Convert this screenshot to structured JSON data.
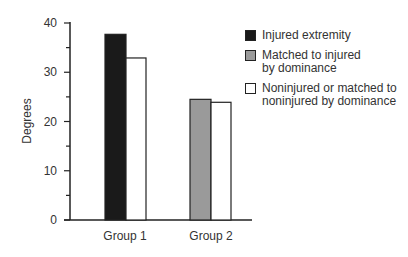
{
  "chart_data": {
    "type": "bar",
    "title": "",
    "xlabel": "",
    "ylabel": "Degrees",
    "ylim": [
      0,
      40
    ],
    "yticks": [
      0,
      10,
      20,
      30,
      40
    ],
    "grid": false,
    "legend_position": "top-right",
    "categories": [
      "Group 1",
      "Group 2"
    ],
    "series": [
      {
        "name": "Injured extremity",
        "color": "#1a1a1a",
        "values": [
          37.7,
          null
        ]
      },
      {
        "name": "Matched to injured by dominance",
        "color": "#9a9a9a",
        "values": [
          null,
          24.5
        ]
      },
      {
        "name": "Noninjured or matched to noninjured by dominance",
        "color": "#ffffff",
        "values": [
          32.9,
          23.9
        ]
      }
    ]
  },
  "legend": {
    "items": [
      {
        "label": "Injured extremity",
        "color": "#1a1a1a"
      },
      {
        "label": "Matched to injured by dominance",
        "color": "#9a9a9a"
      },
      {
        "label": "Noninjured or matched to noninjured by dominance",
        "color": "#ffffff"
      }
    ]
  },
  "axis": {
    "ylabel": "Degrees",
    "yticks": [
      "0",
      "10",
      "20",
      "30",
      "40"
    ],
    "categories": [
      "Group 1",
      "Group 2"
    ]
  }
}
